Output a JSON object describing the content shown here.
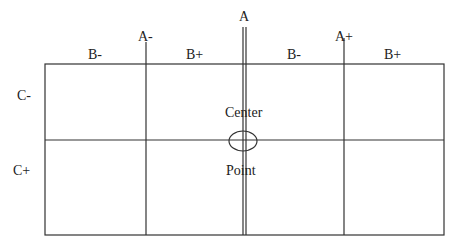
{
  "diagram": {
    "labels": {
      "a_top": "A",
      "a_minus": "A-",
      "a_plus": "A+",
      "b_minus_left": "B-",
      "b_plus_left": "B+",
      "b_minus_right": "B-",
      "b_plus_right": "B+",
      "c_minus": "C-",
      "c_plus": "C+",
      "center": "Center",
      "point": "Point"
    },
    "stroke_color": "#333333",
    "grid": {
      "columns": 4,
      "rows": 2
    }
  }
}
